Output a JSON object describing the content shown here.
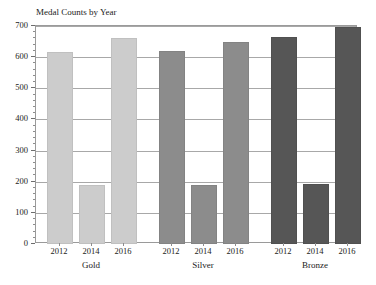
{
  "chart_data": {
    "type": "bar",
    "title": "Medal Counts by Year",
    "xlabel": "",
    "ylabel": "",
    "ylim": [
      0,
      700
    ],
    "yticks": [
      0,
      100,
      200,
      300,
      400,
      500,
      600,
      700
    ],
    "grid": true,
    "legend": "none",
    "groups": [
      "Gold",
      "Silver",
      "Bronze"
    ],
    "categories": [
      "2012",
      "2014",
      "2016"
    ],
    "series": [
      {
        "name": "Gold",
        "color": "#cccccc",
        "categories": [
          "2012",
          "2014",
          "2016"
        ],
        "values": [
          615,
          188,
          660
        ]
      },
      {
        "name": "Silver",
        "color": "#8c8c8c",
        "categories": [
          "2012",
          "2014",
          "2016"
        ],
        "values": [
          620,
          190,
          650
        ]
      },
      {
        "name": "Bronze",
        "color": "#565656",
        "categories": [
          "2012",
          "2014",
          "2016"
        ],
        "values": [
          665,
          192,
          698
        ]
      }
    ]
  },
  "colors": {
    "gold": "#cccccc",
    "silver": "#8c8c8c",
    "bronze": "#565656",
    "grid": "#a8a8a8",
    "frame": "#9a9a9a",
    "text": "#222222",
    "background": "#ffffff"
  }
}
